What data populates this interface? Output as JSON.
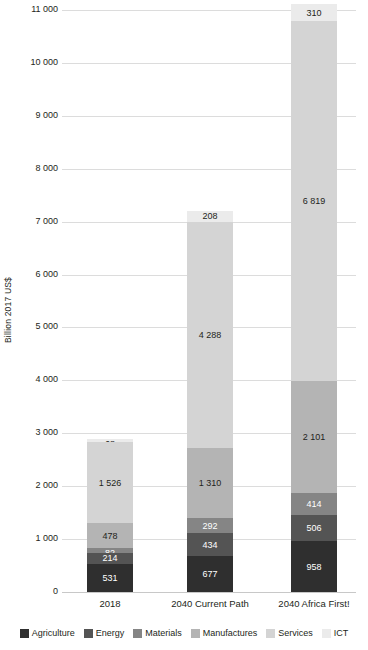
{
  "chart_data": {
    "type": "bar",
    "stacked": true,
    "title": "",
    "xlabel": "",
    "ylabel": "Billion 2017 US$",
    "ylim": [
      0,
      11000
    ],
    "ytick_step": 1000,
    "grid": true,
    "legend_position": "bottom",
    "categories": [
      "2018",
      "2040 Current Path",
      "2040 Africa First!"
    ],
    "ytick_labels": [
      "0",
      "1 000",
      "2 000",
      "3 000",
      "4 000",
      "5 000",
      "6 000",
      "7 000",
      "8 000",
      "9 000",
      "10 000",
      "11 000"
    ],
    "ytick_values": [
      0,
      1000,
      2000,
      3000,
      4000,
      5000,
      6000,
      7000,
      8000,
      9000,
      10000,
      11000
    ],
    "series": [
      {
        "name": "Agriculture",
        "color": "#2f2f2f",
        "values": [
          531,
          677,
          958
        ],
        "labels": [
          "531",
          "677",
          "958"
        ],
        "label_color": "light"
      },
      {
        "name": "Energy",
        "color": "#545454",
        "values": [
          214,
          434,
          506
        ],
        "labels": [
          "214",
          "434",
          "506"
        ],
        "label_color": "light"
      },
      {
        "name": "Materials",
        "color": "#858585",
        "values": [
          82,
          292,
          414
        ],
        "labels": [
          "82",
          "292",
          "414"
        ],
        "label_color": "light"
      },
      {
        "name": "Manufactures",
        "color": "#b4b4b4",
        "values": [
          478,
          1310,
          2101
        ],
        "labels": [
          "478",
          "1 310",
          "2 101"
        ],
        "label_color": "dark"
      },
      {
        "name": "Services",
        "color": "#d4d4d4",
        "values": [
          1526,
          4288,
          6819
        ],
        "labels": [
          "1 526",
          "4 288",
          "6 819"
        ],
        "label_color": "dark"
      },
      {
        "name": "ICT",
        "color": "#ebebeb",
        "values": [
          68,
          208,
          310
        ],
        "labels": [
          "68",
          "208",
          "310"
        ],
        "label_color": "dark"
      }
    ],
    "totals": [
      2899,
      7209,
      11108
    ]
  },
  "axis": {
    "y_title": "Billion 2017 US$"
  },
  "legend": {
    "items": [
      {
        "label": "Agriculture",
        "color": "#2f2f2f"
      },
      {
        "label": "Energy",
        "color": "#545454"
      },
      {
        "label": "Materials",
        "color": "#858585"
      },
      {
        "label": "Manufactures",
        "color": "#b4b4b4"
      },
      {
        "label": "Services",
        "color": "#d4d4d4"
      },
      {
        "label": "ICT",
        "color": "#ebebeb"
      }
    ]
  }
}
